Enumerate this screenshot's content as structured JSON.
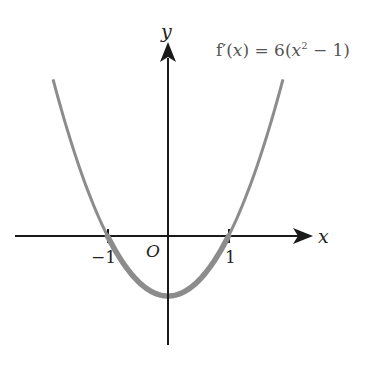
{
  "chart_data": {
    "type": "line",
    "title": "",
    "function_label": "f′(x) = 6(x² − 1)",
    "function_label_parts": {
      "prefix": "f′(",
      "var": "x",
      "mid": ") = 6(",
      "var2": "x",
      "sup": "2",
      "suffix": " − 1)"
    },
    "xlabel": "x",
    "ylabel": "y",
    "origin_label": "O",
    "x_ticks": [
      {
        "value": -1,
        "label": "−1"
      },
      {
        "value": 1,
        "label": "1"
      }
    ],
    "series": [
      {
        "name": "f'(x) = 6(x^2 - 1)",
        "formula": "6*(x^2-1)",
        "x_range": [
          -1.9,
          1.9
        ],
        "color": "#8c8c8c"
      },
      {
        "name": "negative region (highlighted)",
        "formula": "6*(x^2-1)",
        "x_range": [
          -1,
          1
        ],
        "color": "#8c8c8c",
        "emphasis": "thick"
      }
    ],
    "x": [
      -1.9,
      -1.5,
      -1,
      -0.5,
      0,
      0.5,
      1,
      1.5,
      1.9
    ],
    "values": [
      15.66,
      7.5,
      0,
      -4.5,
      -6,
      -4.5,
      0,
      7.5,
      15.66
    ],
    "xlim": [
      -2.5,
      2.2
    ],
    "ylim": [
      -10,
      20
    ],
    "grid": false,
    "legend": "none",
    "axis_color": "#1a1a1a",
    "curve_color": "#8c8c8c"
  }
}
